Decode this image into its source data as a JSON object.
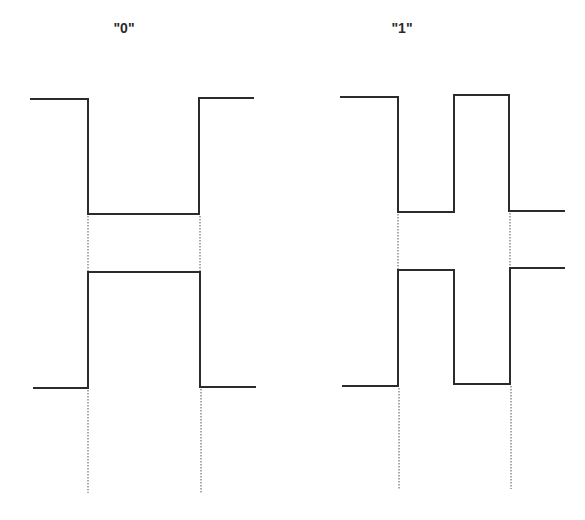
{
  "diagrams": [
    {
      "label": "\"0\"",
      "label_pos": {
        "x": 124,
        "y": 20
      },
      "top_wave": [
        [
          30,
          99
        ],
        [
          88,
          99
        ],
        [
          88,
          214
        ],
        [
          199,
          214
        ],
        [
          199,
          98
        ],
        [
          254,
          98
        ]
      ],
      "bottom_wave": [
        [
          33,
          388
        ],
        [
          88,
          388
        ],
        [
          88,
          272
        ],
        [
          200,
          272
        ],
        [
          200,
          387
        ],
        [
          256,
          387
        ]
      ],
      "guides": [
        [
          [
            88,
            216
          ],
          [
            88,
            271
          ]
        ],
        [
          [
            200,
            216
          ],
          [
            200,
            271
          ]
        ],
        [
          [
            88,
            390
          ],
          [
            88,
            493
          ]
        ],
        [
          [
            201,
            389
          ],
          [
            201,
            493
          ]
        ]
      ]
    },
    {
      "label": "\"1\"",
      "label_pos": {
        "x": 402,
        "y": 20
      },
      "top_wave": [
        [
          340,
          97
        ],
        [
          398,
          97
        ],
        [
          398,
          212
        ],
        [
          454,
          212
        ],
        [
          454,
          95
        ],
        [
          509,
          95
        ],
        [
          509,
          211
        ],
        [
          565,
          211
        ]
      ],
      "bottom_wave": [
        [
          342,
          386
        ],
        [
          398,
          386
        ],
        [
          398,
          270
        ],
        [
          454,
          270
        ],
        [
          454,
          384
        ],
        [
          510,
          384
        ],
        [
          510,
          268
        ],
        [
          565,
          268
        ]
      ],
      "guides": [
        [
          [
            398,
            214
          ],
          [
            398,
            269
          ]
        ],
        [
          [
            510,
            213
          ],
          [
            510,
            267
          ]
        ],
        [
          [
            399,
            388
          ],
          [
            399,
            490
          ]
        ],
        [
          [
            511,
            386
          ],
          [
            511,
            489
          ]
        ]
      ]
    }
  ],
  "colors": {
    "line": "#2b2b2b",
    "guide": "#555555",
    "background": "#ffffff"
  }
}
